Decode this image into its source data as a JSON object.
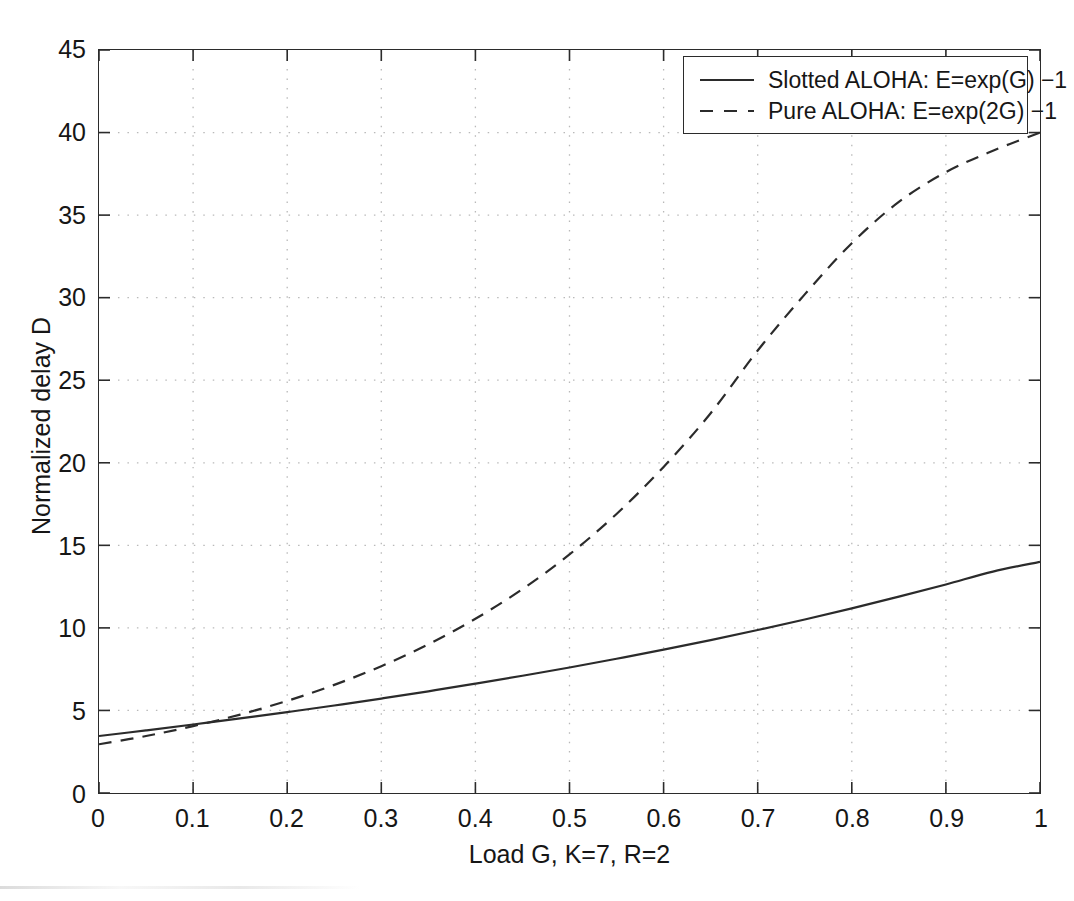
{
  "chart_data": {
    "type": "line",
    "title": "",
    "xlabel": "Load G,  K=7, R=2",
    "ylabel": "Normalized delay D",
    "xlim": [
      0,
      1
    ],
    "ylim": [
      0,
      45
    ],
    "xticks": [
      "0",
      "0.1",
      "0.2",
      "0.3",
      "0.4",
      "0.5",
      "0.6",
      "0.7",
      "0.8",
      "0.9",
      "1"
    ],
    "xtick_values": [
      0,
      0.1,
      0.2,
      0.3,
      0.4,
      0.5,
      0.6,
      0.7,
      0.8,
      0.9,
      1
    ],
    "yticks": [
      "0",
      "5",
      "10",
      "15",
      "20",
      "25",
      "30",
      "35",
      "40",
      "45"
    ],
    "ytick_values": [
      0,
      5,
      10,
      15,
      20,
      25,
      30,
      35,
      40,
      45
    ],
    "grid": true,
    "grid_style": "dotted",
    "grid_color": "#b9b9b9",
    "legend_position": "top-right",
    "axis_color": "#2b2b2b",
    "series": [
      {
        "name": "Slotted ALOHA: E=exp(G) −1",
        "style": "solid",
        "color": "#2b2b2b",
        "width": 2.2,
        "x": [
          0,
          0.05,
          0.1,
          0.15,
          0.2,
          0.25,
          0.3,
          0.35,
          0.4,
          0.45,
          0.5,
          0.55,
          0.6,
          0.65,
          0.7,
          0.75,
          0.8,
          0.85,
          0.9,
          0.95,
          1
        ],
        "y": [
          3.45,
          3.79,
          4.15,
          4.52,
          4.9,
          5.3,
          5.72,
          6.16,
          6.62,
          7.1,
          7.6,
          8.13,
          8.68,
          9.26,
          9.87,
          10.51,
          11.18,
          11.89,
          12.63,
          13.41,
          14.0
        ]
      },
      {
        "name": "Pure ALOHA: E=exp(2G) −1",
        "style": "dashed",
        "color": "#2b2b2b",
        "width": 2.2,
        "dash": [
          13,
          9
        ],
        "x": [
          0,
          0.05,
          0.1,
          0.15,
          0.2,
          0.25,
          0.3,
          0.35,
          0.4,
          0.45,
          0.5,
          0.55,
          0.6,
          0.65,
          0.7,
          0.75,
          0.8,
          0.85,
          0.9,
          0.95,
          1
        ],
        "y": [
          2.95,
          3.45,
          4.05,
          4.75,
          5.58,
          6.55,
          7.68,
          9.0,
          10.55,
          12.35,
          14.45,
          16.9,
          19.75,
          23.0,
          26.8,
          30.2,
          33.3,
          35.8,
          37.6,
          38.9,
          40.0
        ]
      }
    ]
  },
  "legend": {
    "entries": [
      {
        "label": "Slotted ALOHA: E=exp(G) −1",
        "style": "solid"
      },
      {
        "label": "Pure ALOHA: E=exp(2G) −1",
        "style": "dashed"
      }
    ]
  }
}
